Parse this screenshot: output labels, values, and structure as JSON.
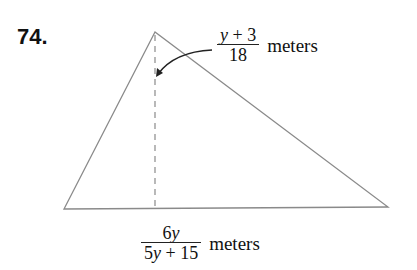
{
  "problem": {
    "number": "74."
  },
  "figure": {
    "shape": "triangle",
    "vertices": {
      "apex": [
        155,
        32
      ],
      "base_left": [
        64,
        209
      ],
      "base_right": [
        388,
        207
      ]
    },
    "altitude": {
      "x": 155,
      "y_top": 34,
      "y_bottom": 208,
      "style": "dashed"
    },
    "line_color": "#8a8a8a",
    "arrow_color": "#222222"
  },
  "height_label": {
    "numerator_var": "y",
    "numerator_rest": " + 3",
    "denominator": "18",
    "unit": "meters"
  },
  "base_label": {
    "numerator_coef": "6",
    "numerator_var": "y",
    "denominator_coef": "5",
    "denominator_var": "y",
    "denominator_rest": " + 15",
    "unit": "meters"
  }
}
